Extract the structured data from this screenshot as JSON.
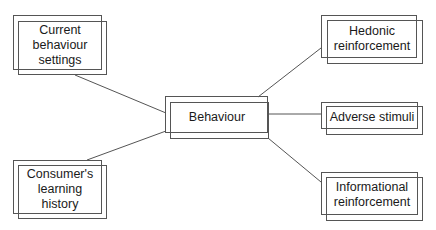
{
  "diagram": {
    "type": "concept-map",
    "center": {
      "id": "behaviour",
      "label": "Behaviour",
      "lines": [
        "Behaviour"
      ]
    },
    "inputs": [
      {
        "id": "current-behaviour-settings",
        "label": "Current behaviour settings",
        "lines": [
          "Current",
          "behaviour",
          "settings"
        ]
      },
      {
        "id": "consumers-learning-history",
        "label": "Consumer's learning history",
        "lines": [
          "Consumer's",
          "learning",
          "history"
        ]
      }
    ],
    "outputs": [
      {
        "id": "hedonic-reinforcement",
        "label": "Hedonic reinforcement",
        "lines": [
          "Hedonic",
          "reinforcement"
        ]
      },
      {
        "id": "adverse-stimuli",
        "label": "Adverse stimuli",
        "lines": [
          "Adverse stimuli"
        ]
      },
      {
        "id": "informational-reinforcement",
        "label": "Informational reinforcement",
        "lines": [
          "Informational",
          "reinforcement"
        ]
      }
    ],
    "edges": [
      {
        "from": "current-behaviour-settings",
        "to": "behaviour"
      },
      {
        "from": "consumers-learning-history",
        "to": "behaviour"
      },
      {
        "from": "behaviour",
        "to": "hedonic-reinforcement"
      },
      {
        "from": "behaviour",
        "to": "adverse-stimuli"
      },
      {
        "from": "behaviour",
        "to": "informational-reinforcement"
      }
    ],
    "colors": {
      "stroke": "#555555",
      "text": "#1a1a1a",
      "background": "#ffffff"
    }
  }
}
